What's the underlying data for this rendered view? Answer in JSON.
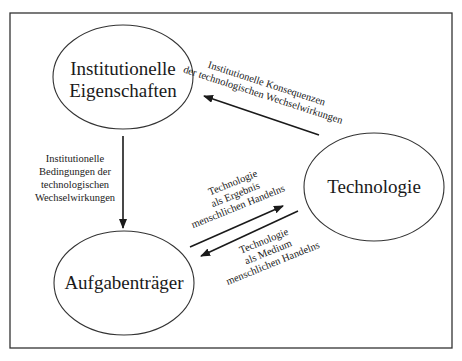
{
  "diagram": {
    "type": "cycle-relationship-diagram",
    "nodes": [
      {
        "id": "institutionelle",
        "lines": [
          "Institutionelle",
          "Eigenschaften"
        ]
      },
      {
        "id": "technologie",
        "lines": [
          "Technologie"
        ]
      },
      {
        "id": "aufgabentraeger",
        "lines": [
          "Aufgabenträger"
        ]
      }
    ],
    "edges": [
      {
        "from": "technologie",
        "to": "institutionelle",
        "lines": [
          "Institutionelle Konsequenzen",
          "der technologischen Wechselwirkungen"
        ]
      },
      {
        "from": "institutionelle",
        "to": "aufgabentraeger",
        "lines": [
          "Institutionelle",
          "Bedingungen der",
          "technologischen",
          "Wechselwirkungen"
        ]
      },
      {
        "from": "aufgabentraeger",
        "to": "technologie",
        "lines": [
          "Technologie",
          "als Ergebnis",
          "menschlichen Handelns"
        ]
      },
      {
        "from": "technologie",
        "to": "aufgabentraeger",
        "lines": [
          "Technologie",
          "als Medium",
          "menschlichen Handelns"
        ]
      }
    ],
    "colors": {
      "stroke": "#2a2a2a",
      "text": "#1a1a1a",
      "background": "#ffffff"
    }
  }
}
